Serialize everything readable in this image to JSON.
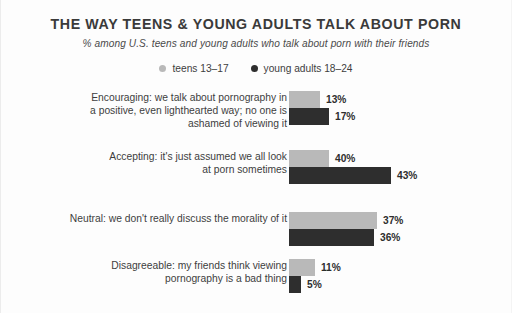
{
  "chart_data": {
    "type": "bar",
    "orientation": "horizontal",
    "title": "THE WAY TEENS & YOUNG ADULTS TALK ABOUT PORN",
    "subtitle": "% among U.S. teens and young adults who talk about porn with their friends",
    "xlabel": "",
    "ylabel": "",
    "xlim": [
      0,
      43
    ],
    "grid": false,
    "legend_position": "top-center",
    "value_suffix": "%",
    "colors": {
      "teens": "#b9b9b9",
      "young_adults": "#2e2e2e",
      "text": "#3d3d3d",
      "background": "#fdfdfd"
    },
    "categories": [
      "Encouraging: we talk about pornography in a positive, even lighthearted way; no one is ashamed of viewing it",
      "Accepting: it's just assumed we all look at porn sometimes",
      "Neutral: we don't really discuss the morality of it",
      "Disagreeable: my friends think viewing pornography is a bad thing"
    ],
    "series": [
      {
        "name": "teens 13–17",
        "key": "teens",
        "values": [
          13,
          17,
          37,
          11
        ]
      },
      {
        "name": "young adults 18–24",
        "key": "young_adults",
        "values": [
          17,
          43,
          36,
          5
        ]
      }
    ]
  },
  "legend": {
    "items": [
      {
        "label": "teens 13–17",
        "color": "#b9b9b9"
      },
      {
        "label": "young adults 18–24",
        "color": "#2e2e2e"
      }
    ]
  },
  "groups": [
    {
      "label_lines": [
        "Encouraging: we talk about pornography in",
        "a positive, even lighthearted way; no one is",
        "ashamed of viewing it"
      ],
      "teens_value": "13%",
      "adults_value": "17%"
    },
    {
      "label_lines": [
        "Accepting: it's just assumed we all look",
        "at porn sometimes"
      ],
      "teens_value": "40%",
      "adults_value": "43%"
    },
    {
      "label_lines": [
        "Neutral: we don't really discuss the morality of it"
      ],
      "teens_value": "37%",
      "adults_value": "36%"
    },
    {
      "label_lines": [
        "Disagreeable: my friends think viewing",
        "pornography is a bad thing"
      ],
      "teens_value": "11%",
      "adults_value": "5%"
    }
  ]
}
